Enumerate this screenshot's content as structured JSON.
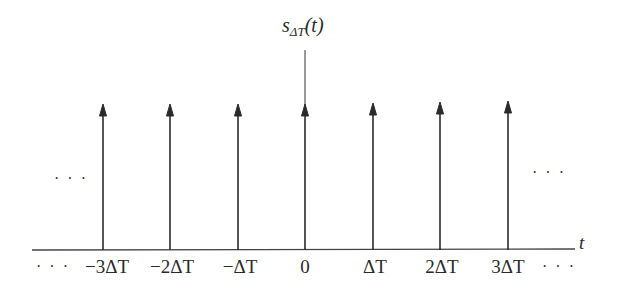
{
  "diagram": {
    "title": {
      "base": "s",
      "subscript": "ΔT",
      "argument": "(t)"
    },
    "axis_label": "t",
    "impulse_positions": [
      -3,
      -2,
      -1,
      0,
      1,
      2,
      3
    ],
    "tick_labels": [
      "−3ΔT",
      "−2ΔT",
      "−ΔT",
      "0",
      "ΔT",
      "2ΔT",
      "3ΔT"
    ],
    "ellipsis_left_mid": "· · ·",
    "ellipsis_right_mid": "· · ·",
    "ellipsis_left_axis": "· · ·",
    "ellipsis_right_axis": "· · ·",
    "colors": {
      "line": "#2a2a2a",
      "background": "#ffffff"
    }
  }
}
